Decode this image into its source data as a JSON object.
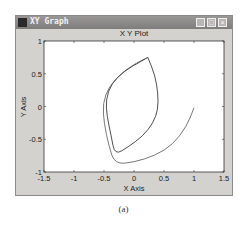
{
  "window": {
    "title": "XY Graph",
    "buttons": {
      "minimize": "_",
      "maximize": "□",
      "close": "×"
    }
  },
  "caption": "(a)",
  "chart_data": {
    "type": "line",
    "title": "X Y Plot",
    "xlabel": "X Axis",
    "ylabel": "Y Axis",
    "xlim": [
      -1.5,
      1.5
    ],
    "ylim": [
      -1,
      1
    ],
    "xticks": [
      "-1.5",
      "-1",
      "-0.5",
      "0",
      "0.5",
      "1",
      "1.5"
    ],
    "yticks": [
      "1",
      "0.5",
      "0",
      "-0.5",
      "-1"
    ],
    "grid": false,
    "legend": null,
    "series": [
      {
        "name": "inner lens",
        "x": [
          0.23,
          0.1,
          -0.15,
          -0.38,
          -0.47,
          -0.45,
          -0.38,
          -0.32,
          -0.1,
          0.15,
          0.32,
          0.4,
          0.4,
          0.35,
          0.23
        ],
        "y": [
          0.75,
          0.68,
          0.55,
          0.35,
          0.1,
          -0.15,
          -0.45,
          -0.74,
          -0.62,
          -0.45,
          -0.25,
          -0.05,
          0.2,
          0.48,
          0.75
        ]
      },
      {
        "name": "outer spiral",
        "x": [
          0.23,
          0.05,
          -0.2,
          -0.42,
          -0.52,
          -0.5,
          -0.42,
          -0.32,
          0.0,
          0.35,
          0.65,
          0.88,
          1.0
        ],
        "y": [
          0.75,
          0.67,
          0.52,
          0.3,
          0.05,
          -0.25,
          -0.6,
          -0.88,
          -0.85,
          -0.75,
          -0.58,
          -0.3,
          -0.02
        ]
      }
    ]
  }
}
